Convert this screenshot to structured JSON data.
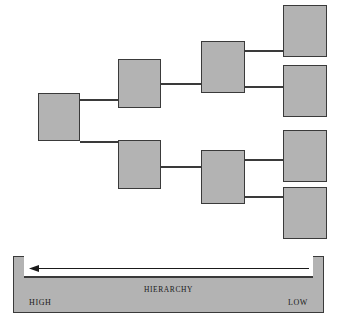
{
  "diagram": {
    "type": "hierarchy-tree",
    "title_label": "HIERARCHY",
    "colors": {
      "node_fill": "#b3b3b3",
      "node_stroke": "#3a3a3a",
      "background": "#ffffff",
      "text": "#1a1a1a"
    },
    "scale": {
      "label": "HIERARCHY",
      "left_label": "HIGH",
      "right_label": "LOW",
      "arrow_direction": "left",
      "arrow_meaning": "LOW to HIGH"
    },
    "nodes": [
      {
        "id": "root",
        "level": 1,
        "x": 38,
        "y": 93,
        "w": 42,
        "h": 48
      },
      {
        "id": "l2-up",
        "level": 2,
        "x": 118,
        "y": 59,
        "w": 43,
        "h": 49
      },
      {
        "id": "l2-dn",
        "level": 2,
        "x": 118,
        "y": 140,
        "w": 43,
        "h": 49
      },
      {
        "id": "l3-up",
        "level": 3,
        "x": 201,
        "y": 41,
        "w": 44,
        "h": 52
      },
      {
        "id": "l3-dn",
        "level": 3,
        "x": 201,
        "y": 150,
        "w": 44,
        "h": 54
      },
      {
        "id": "leaf-1",
        "level": 4,
        "x": 283,
        "y": 5,
        "w": 44,
        "h": 52
      },
      {
        "id": "leaf-2",
        "level": 4,
        "x": 283,
        "y": 65,
        "w": 44,
        "h": 52
      },
      {
        "id": "leaf-3",
        "level": 4,
        "x": 283,
        "y": 130,
        "w": 44,
        "h": 52
      },
      {
        "id": "leaf-4",
        "level": 4,
        "x": 283,
        "y": 187,
        "w": 44,
        "h": 52
      }
    ],
    "edges": [
      {
        "from": "root",
        "to": "l2-up",
        "x": 80,
        "y": 99,
        "len": 38
      },
      {
        "from": "root",
        "to": "l2-dn",
        "x": 80,
        "y": 141,
        "len": 38
      },
      {
        "from": "l2-up",
        "to": "l3-up",
        "x": 161,
        "y": 83,
        "len": 40
      },
      {
        "from": "l2-dn",
        "to": "l3-dn",
        "x": 161,
        "y": 166,
        "len": 40
      },
      {
        "from": "l3-up",
        "to": "leaf-1",
        "x": 245,
        "y": 50,
        "len": 38
      },
      {
        "from": "l3-up",
        "to": "leaf-2",
        "x": 245,
        "y": 86,
        "len": 38
      },
      {
        "from": "l3-dn",
        "to": "leaf-3",
        "x": 245,
        "y": 159,
        "len": 38
      },
      {
        "from": "l3-dn",
        "to": "leaf-4",
        "x": 245,
        "y": 196,
        "len": 38
      }
    ]
  }
}
